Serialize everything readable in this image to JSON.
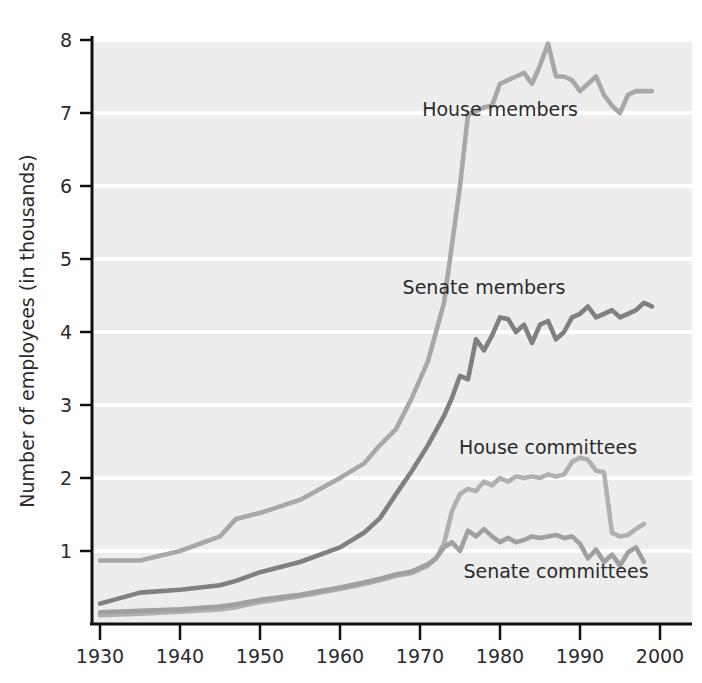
{
  "chart_data": {
    "type": "line",
    "title": "",
    "subtitle": "",
    "xlabel": "",
    "ylabel": "Number of employees (in thousands)",
    "xlim": [
      1930,
      2000
    ],
    "ylim": [
      0,
      8
    ],
    "xticks": [
      1930,
      1940,
      1950,
      1960,
      1970,
      1980,
      1990,
      2000
    ],
    "xtick_labels": [
      "1930",
      "1940",
      "1950",
      "1960",
      "1970",
      "1980",
      "1990",
      "2000"
    ],
    "yticks": [
      1,
      2,
      3,
      4,
      5,
      6,
      7,
      8
    ],
    "ytick_labels": [
      "1",
      "2",
      "3",
      "4",
      "5",
      "6",
      "7",
      "8"
    ],
    "grid": "horizontal",
    "grid_color": "#ffffff",
    "plot_background": "#eeeeee",
    "axis_color": "#111111",
    "legend_position": "inline-annotations",
    "series": [
      {
        "name": "House members",
        "color": "#a8a8a8",
        "label_x": 1980,
        "label_y": 7.05,
        "x": [
          1930,
          1935,
          1940,
          1945,
          1947,
          1950,
          1955,
          1960,
          1963,
          1965,
          1967,
          1969,
          1971,
          1973,
          1974,
          1975,
          1976,
          1977,
          1978,
          1979,
          1980,
          1981,
          1982,
          1983,
          1984,
          1985,
          1986,
          1987,
          1988,
          1989,
          1990,
          1991,
          1992,
          1993,
          1994,
          1995,
          1996,
          1997,
          1998,
          1999
        ],
        "y": [
          0.87,
          0.87,
          1.0,
          1.2,
          1.44,
          1.52,
          1.7,
          2.0,
          2.2,
          2.45,
          2.67,
          3.1,
          3.6,
          4.4,
          5.2,
          6.0,
          6.98,
          7.02,
          7.08,
          7.1,
          7.4,
          7.45,
          7.5,
          7.55,
          7.4,
          7.65,
          7.95,
          7.5,
          7.5,
          7.45,
          7.3,
          7.4,
          7.5,
          7.25,
          7.1,
          7.0,
          7.25,
          7.3,
          7.3,
          7.3
        ]
      },
      {
        "name": "Senate members",
        "color": "#808080",
        "label_x": 1978,
        "label_y": 4.62,
        "x": [
          1930,
          1935,
          1940,
          1945,
          1947,
          1950,
          1955,
          1960,
          1963,
          1965,
          1967,
          1969,
          1971,
          1973,
          1974,
          1975,
          1976,
          1977,
          1978,
          1979,
          1980,
          1981,
          1982,
          1983,
          1984,
          1985,
          1986,
          1987,
          1988,
          1989,
          1990,
          1991,
          1992,
          1993,
          1994,
          1995,
          1996,
          1997,
          1998,
          1999
        ],
        "y": [
          0.28,
          0.43,
          0.47,
          0.53,
          0.59,
          0.71,
          0.85,
          1.05,
          1.25,
          1.45,
          1.78,
          2.1,
          2.45,
          2.85,
          3.1,
          3.4,
          3.35,
          3.9,
          3.75,
          3.95,
          4.2,
          4.18,
          4.0,
          4.1,
          3.85,
          4.1,
          4.15,
          3.9,
          4.0,
          4.2,
          4.25,
          4.35,
          4.2,
          4.25,
          4.3,
          4.2,
          4.25,
          4.3,
          4.4,
          4.35
        ]
      },
      {
        "name": "House committees",
        "color": "#b0b0b0",
        "label_x": 1986,
        "label_y": 2.42,
        "x": [
          1930,
          1935,
          1940,
          1945,
          1947,
          1950,
          1955,
          1960,
          1963,
          1965,
          1967,
          1969,
          1971,
          1972,
          1973,
          1974,
          1975,
          1976,
          1977,
          1978,
          1979,
          1980,
          1981,
          1982,
          1983,
          1984,
          1985,
          1986,
          1987,
          1988,
          1989,
          1990,
          1991,
          1992,
          1993,
          1994,
          1995,
          1996,
          1997,
          1998
        ],
        "y": [
          0.12,
          0.14,
          0.17,
          0.2,
          0.23,
          0.3,
          0.38,
          0.48,
          0.55,
          0.6,
          0.66,
          0.7,
          0.8,
          0.9,
          1.1,
          1.55,
          1.78,
          1.85,
          1.82,
          1.95,
          1.9,
          2.0,
          1.95,
          2.02,
          2.0,
          2.02,
          2.0,
          2.05,
          2.02,
          2.05,
          2.22,
          2.28,
          2.25,
          2.1,
          2.08,
          1.25,
          1.2,
          1.22,
          1.3,
          1.37
        ]
      },
      {
        "name": "Senate committees",
        "color": "#a0a0a0",
        "label_x": 1987,
        "label_y": 0.72,
        "x": [
          1930,
          1935,
          1940,
          1945,
          1947,
          1950,
          1955,
          1960,
          1963,
          1965,
          1967,
          1969,
          1971,
          1972,
          1973,
          1974,
          1975,
          1976,
          1977,
          1978,
          1979,
          1980,
          1981,
          1982,
          1983,
          1984,
          1985,
          1986,
          1987,
          1988,
          1989,
          1990,
          1991,
          1992,
          1993,
          1994,
          1995,
          1996,
          1997,
          1998
        ],
        "y": [
          0.16,
          0.18,
          0.2,
          0.24,
          0.27,
          0.33,
          0.4,
          0.5,
          0.57,
          0.62,
          0.68,
          0.72,
          0.82,
          0.9,
          1.05,
          1.12,
          1.0,
          1.28,
          1.2,
          1.3,
          1.2,
          1.12,
          1.18,
          1.12,
          1.15,
          1.2,
          1.18,
          1.2,
          1.22,
          1.18,
          1.2,
          1.1,
          0.9,
          1.02,
          0.85,
          0.95,
          0.8,
          0.98,
          1.05,
          0.85
        ]
      }
    ]
  },
  "labels": {
    "house_members": "House members",
    "senate_members": "Senate members",
    "house_committees": "House committees",
    "senate_committees": "Senate committees",
    "y_axis_title": "Number of employees (in thousands)"
  }
}
